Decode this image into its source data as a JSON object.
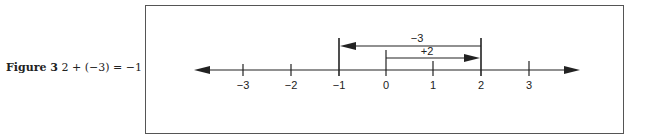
{
  "caption": {
    "figure_label": "Figure 3",
    "equation": "2 + (−3) = −1"
  },
  "number_line": {
    "ticks": [
      {
        "value": -3,
        "label": "−3",
        "x": 243
      },
      {
        "value": -2,
        "label": "−2",
        "x": 291
      },
      {
        "value": -1,
        "label": "−1",
        "x": 339
      },
      {
        "value": 0,
        "label": "0",
        "x": 386
      },
      {
        "value": 1,
        "label": "1",
        "x": 433
      },
      {
        "value": 2,
        "label": "2",
        "x": 481
      },
      {
        "value": 3,
        "label": "3",
        "x": 529
      }
    ],
    "arrows": [
      {
        "name": "plus-2",
        "label": "+2",
        "from": 0,
        "to": 2
      },
      {
        "name": "minus-3",
        "label": "−3",
        "from": 2,
        "to": -1
      }
    ]
  },
  "colors": {
    "line": "#222222",
    "frame": "#555555"
  }
}
